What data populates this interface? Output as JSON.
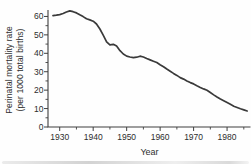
{
  "chart_data": {
    "type": "line",
    "title": "",
    "xlabel": "Year",
    "ylabel_line1": "Perinatal mortality rate",
    "ylabel_line2": "(per 1000 total births)",
    "x_range": [
      1926.5,
      1987
    ],
    "y_range": [
      0,
      63.5
    ],
    "x_major_ticks": [
      1930,
      1940,
      1950,
      1960,
      1970,
      1980
    ],
    "x_minor_ticks": [
      1935,
      1945,
      1955,
      1965,
      1975,
      1985
    ],
    "y_major_ticks": [
      0,
      10,
      20,
      30,
      40,
      50,
      60
    ],
    "y_minor_ticks": [
      5,
      15,
      25,
      35,
      45,
      55
    ],
    "grid": false,
    "legend": "none",
    "line_color": "#3a3a3a",
    "axis_color": "#3f3f3f",
    "text_color": "#2d2d2d",
    "background_color": "#fefefe",
    "series": [
      {
        "name": "Perinatal mortality rate",
        "x": [
          1928,
          1929,
          1930,
          1931,
          1932,
          1933,
          1934,
          1935,
          1936,
          1937,
          1938,
          1939,
          1940,
          1941,
          1942,
          1943,
          1944,
          1945,
          1946,
          1947,
          1948,
          1949,
          1950,
          1951,
          1952,
          1953,
          1954,
          1955,
          1956,
          1957,
          1958,
          1959,
          1960,
          1961,
          1962,
          1963,
          1964,
          1965,
          1966,
          1967,
          1968,
          1969,
          1970,
          1971,
          1972,
          1973,
          1974,
          1975,
          1976,
          1977,
          1978,
          1979,
          1980,
          1981,
          1982,
          1983,
          1984,
          1985,
          1986
        ],
        "y": [
          60.4,
          60.7,
          61.0,
          61.6,
          62.4,
          63.0,
          62.6,
          61.9,
          60.9,
          59.9,
          58.7,
          58.1,
          57.4,
          55.9,
          53.2,
          49.8,
          46.2,
          44.6,
          44.9,
          43.9,
          41.4,
          39.6,
          38.5,
          38.0,
          37.6,
          37.9,
          38.4,
          38.0,
          37.2,
          36.4,
          35.7,
          35.0,
          33.8,
          32.7,
          31.5,
          30.3,
          29.1,
          28.0,
          26.8,
          26.0,
          25.0,
          24.1,
          23.4,
          22.4,
          21.5,
          20.7,
          19.9,
          18.7,
          17.4,
          16.3,
          15.2,
          14.3,
          13.3,
          12.3,
          11.3,
          10.6,
          9.9,
          9.3,
          8.7
        ]
      }
    ]
  }
}
